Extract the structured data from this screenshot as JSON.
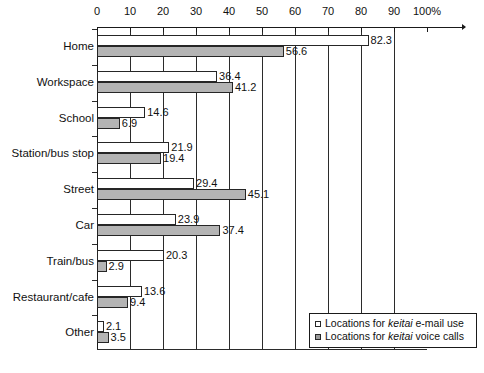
{
  "chart_data": {
    "type": "bar",
    "orientation": "horizontal",
    "title": "",
    "xlabel": "",
    "ylabel": "",
    "xlim": [
      0,
      100
    ],
    "xticks": [
      0,
      10,
      20,
      30,
      40,
      50,
      60,
      70,
      80,
      90,
      100
    ],
    "xtick_labels": [
      "0",
      "10",
      "20",
      "30",
      "40",
      "50",
      "60",
      "70",
      "80",
      "90",
      "100%"
    ],
    "grid": true,
    "grid_axis": "x",
    "legend_position": "bottom-right",
    "categories": [
      "Home",
      "Workspace",
      "School",
      "Station/bus stop",
      "Street",
      "Car",
      "Train/bus",
      "Restaurant/cafe",
      "Other"
    ],
    "series": [
      {
        "name": "Locations for keitai e-mail use",
        "key": "email",
        "color": "#ffffff",
        "values": [
          82.3,
          36.4,
          14.6,
          21.9,
          29.4,
          23.9,
          20.3,
          13.6,
          2.1
        ]
      },
      {
        "name": "Locations for keitai voice calls",
        "key": "voice",
        "color": "#b4b4b4",
        "values": [
          56.6,
          41.2,
          6.9,
          19.4,
          45.1,
          37.4,
          2.9,
          9.4,
          3.5
        ]
      }
    ]
  },
  "legend": {
    "items": [
      {
        "swatch": "email",
        "prefix": "Locations for ",
        "emphasis": "keitai",
        "suffix": " e-mail use"
      },
      {
        "swatch": "voice",
        "prefix": "Locations for ",
        "emphasis": "keitai",
        "suffix": " voice calls"
      }
    ]
  },
  "colors": {
    "email_bar": "#ffffff",
    "voice_bar": "#b4b4b4",
    "axis": "#1a1a1a",
    "grid": "#2b2b2b",
    "text": "#111111",
    "background": "#ffffff"
  }
}
